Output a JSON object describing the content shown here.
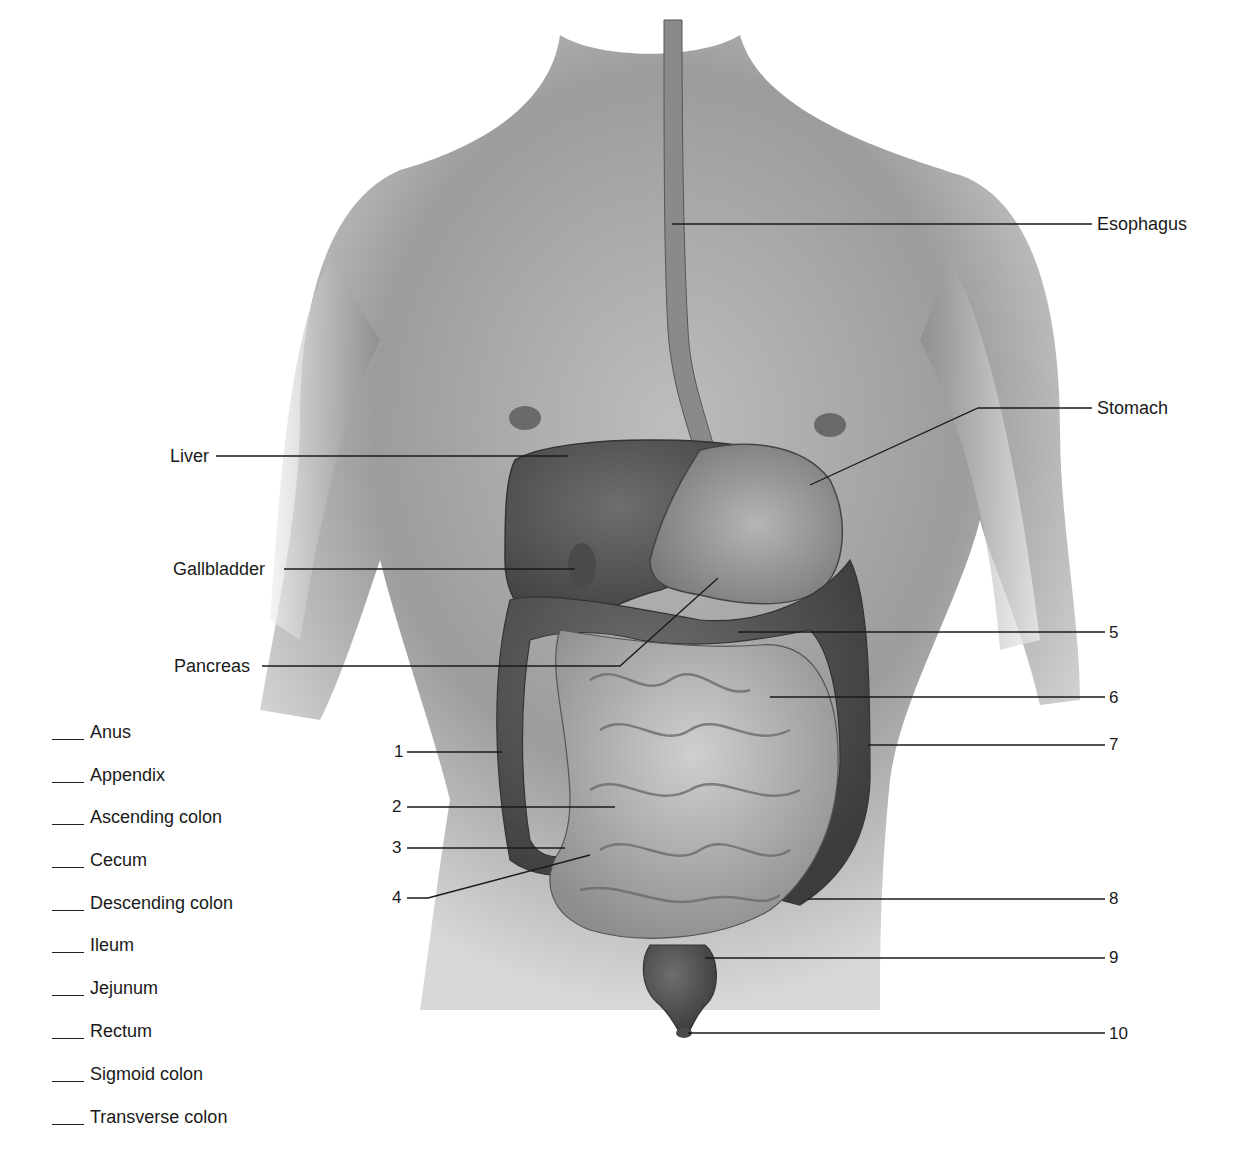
{
  "figure": {
    "labeled_structures": [
      {
        "id": "esophagus",
        "text": "Esophagus"
      },
      {
        "id": "stomach",
        "text": "Stomach"
      },
      {
        "id": "liver",
        "text": "Liver"
      },
      {
        "id": "gallbladder",
        "text": "Gallbladder"
      },
      {
        "id": "pancreas",
        "text": "Pancreas"
      }
    ],
    "numbered_callouts": [
      "1",
      "2",
      "3",
      "4",
      "5",
      "6",
      "7",
      "8",
      "9",
      "10"
    ]
  },
  "word_bank": {
    "items": [
      {
        "blank": "___",
        "term": "Anus"
      },
      {
        "blank": "___",
        "term": "Appendix"
      },
      {
        "blank": "___",
        "term": "Ascending colon"
      },
      {
        "blank": "___",
        "term": "Cecum"
      },
      {
        "blank": "___",
        "term": "Descending colon"
      },
      {
        "blank": "___",
        "term": "Ileum"
      },
      {
        "blank": "___",
        "term": "Jejunum"
      },
      {
        "blank": "___",
        "term": "Rectum"
      },
      {
        "blank": "___",
        "term": "Sigmoid colon"
      },
      {
        "blank": "___",
        "term": "Transverse colon"
      }
    ]
  }
}
